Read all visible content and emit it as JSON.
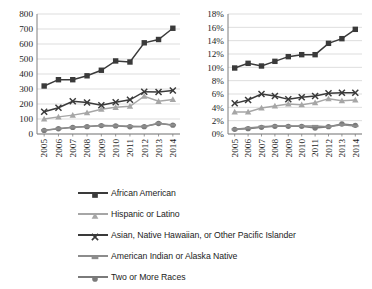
{
  "chart_data": [
    {
      "type": "line",
      "panel": "left",
      "title": "",
      "xlabel": "",
      "ylabel": "",
      "categories": [
        "2005",
        "2006",
        "2007",
        "2008",
        "2009",
        "2010",
        "2011",
        "2012",
        "2013",
        "2014"
      ],
      "ylim": [
        0,
        800
      ],
      "ytick_values": [
        0,
        100,
        200,
        300,
        400,
        500,
        600,
        700,
        800
      ],
      "ytick_labels": [
        "0",
        "100",
        "200",
        "300",
        "400",
        "500",
        "600",
        "700",
        "800"
      ],
      "grid": true,
      "legend_position": "below-figure-shared",
      "series": [
        {
          "name": "African American",
          "marker": "square",
          "color": "#3a3a3a",
          "values": [
            320,
            362,
            362,
            388,
            425,
            487,
            480,
            608,
            630,
            705
          ]
        },
        {
          "name": "Hispanic or Latino",
          "marker": "triangle",
          "color": "#a6a6a6",
          "values": [
            100,
            114,
            126,
            142,
            165,
            178,
            185,
            252,
            218,
            230
          ]
        },
        {
          "name": "Asian, Native Hawaiian, or Other Pacific Islander",
          "marker": "x",
          "color": "#3a3a3a",
          "values": [
            148,
            175,
            218,
            210,
            192,
            212,
            228,
            282,
            280,
            290
          ]
        },
        {
          "name": "American Indian or Alaska Native",
          "marker": "dash",
          "color": "#8c8c8c",
          "values": [
            25,
            36,
            45,
            50,
            57,
            55,
            52,
            50,
            72,
            60
          ]
        },
        {
          "name": "Two or More Races",
          "marker": "diamond",
          "color": "#7a7a7a",
          "values": [
            24,
            35,
            44,
            49,
            56,
            54,
            48,
            49,
            70,
            59
          ]
        }
      ]
    },
    {
      "type": "line",
      "panel": "right",
      "title": "",
      "xlabel": "",
      "ylabel": "",
      "categories": [
        "2005",
        "2006",
        "2007",
        "2008",
        "2009",
        "2010",
        "2011",
        "2012",
        "2013",
        "2014"
      ],
      "ylim": [
        0,
        18
      ],
      "ytick_values": [
        0,
        2,
        4,
        6,
        8,
        10,
        12,
        14,
        16,
        18
      ],
      "ytick_labels": [
        "0%",
        "2%",
        "4%",
        "6%",
        "8%",
        "10%",
        "12%",
        "14%",
        "16%",
        "18%"
      ],
      "grid": true,
      "legend_position": "below-figure-shared",
      "series": [
        {
          "name": "African American",
          "marker": "square",
          "color": "#3a3a3a",
          "values": [
            9.9,
            10.6,
            10.2,
            10.9,
            11.6,
            11.9,
            11.9,
            13.6,
            14.3,
            15.7
          ]
        },
        {
          "name": "Hispanic or Latino",
          "marker": "triangle",
          "color": "#a6a6a6",
          "values": [
            3.3,
            3.3,
            3.9,
            4.2,
            4.5,
            4.4,
            4.7,
            5.3,
            5.0,
            5.1
          ]
        },
        {
          "name": "Asian, Native Hawaiian, or Other Pacific Islander",
          "marker": "x",
          "color": "#3a3a3a",
          "values": [
            4.6,
            5.1,
            6.0,
            5.7,
            5.2,
            5.5,
            5.7,
            6.1,
            6.2,
            6.2
          ]
        },
        {
          "name": "American Indian or Alaska Native",
          "marker": "dash",
          "color": "#8c8c8c",
          "values": [
            0.7,
            0.9,
            1.1,
            1.2,
            1.2,
            1.2,
            1.2,
            1.1,
            1.4,
            1.2
          ]
        },
        {
          "name": "Two or More Races",
          "marker": "diamond",
          "color": "#7a7a7a",
          "values": [
            0.7,
            0.8,
            1.0,
            1.15,
            1.15,
            1.15,
            0.9,
            1.1,
            1.5,
            1.3
          ]
        }
      ]
    }
  ],
  "legend": {
    "items": [
      {
        "label": "African American",
        "marker": "square",
        "color": "#3a3a3a"
      },
      {
        "label": "Hispanic or Latino",
        "marker": "triangle",
        "color": "#a6a6a6"
      },
      {
        "label": "Asian, Native Hawaiian, or Other Pacific Islander",
        "marker": "x",
        "color": "#3a3a3a"
      },
      {
        "label": "American Indian or Alaska Native",
        "marker": "dash",
        "color": "#8c8c8c"
      },
      {
        "label": "Two or More Races",
        "marker": "diamond",
        "color": "#7a7a7a"
      }
    ]
  },
  "style": {
    "axis_color": "#7f7f7f",
    "grid_color": "#d4d4d4",
    "tick_text_color": "#1c1c1c",
    "background": "#ffffff"
  }
}
